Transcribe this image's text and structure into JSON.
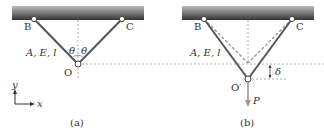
{
  "panels": [
    {
      "id": "a",
      "caption": "(a)",
      "nodes": {
        "B": "B",
        "C": "C",
        "O": "O"
      },
      "bar_properties": "A, E, l",
      "angle_left": "θ",
      "angle_right": "θ",
      "axes": {
        "x": "x",
        "y": "y"
      }
    },
    {
      "id": "b",
      "caption": "(b)",
      "nodes": {
        "B": "B",
        "C": "C",
        "O": "O′"
      },
      "bar_properties": "A, E, l",
      "displacement": "δ",
      "load": "P"
    }
  ],
  "colors": {
    "bar": "#555555",
    "ceiling_top": "#b0b0b0",
    "ceiling_bottom": "#3a3a3a",
    "dashed": "#999999",
    "load_arrow": "#999999",
    "text": "#333333"
  }
}
